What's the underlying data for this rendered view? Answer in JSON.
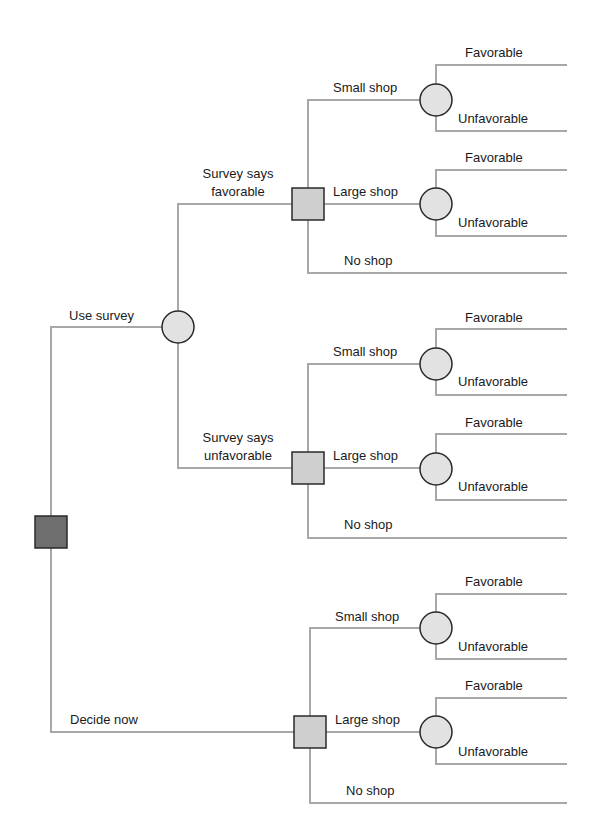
{
  "diagram": {
    "type": "decision-tree",
    "colors": {
      "branch": "#a8a8a8",
      "root_decision_fill": "#6e6e6e",
      "decision_fill": "#cfcfcf",
      "chance_fill": "#e2e2e2",
      "outline": "#2a2a2a",
      "text": "#1a1a1a"
    },
    "root": {
      "node_type": "decision",
      "branches": [
        {
          "label": "Use survey",
          "node_type": "chance",
          "branches": [
            {
              "label_line1": "Survey says",
              "label_line2": "favorable",
              "node_type": "decision",
              "branches": [
                {
                  "label": "Small shop",
                  "node_type": "chance",
                  "outcomes": [
                    "Favorable",
                    "Unfavorable"
                  ]
                },
                {
                  "label": "Large shop",
                  "node_type": "chance",
                  "outcomes": [
                    "Favorable",
                    "Unfavorable"
                  ]
                },
                {
                  "label": "No shop"
                }
              ]
            },
            {
              "label_line1": "Survey says",
              "label_line2": "unfavorable",
              "node_type": "decision",
              "branches": [
                {
                  "label": "Small shop",
                  "node_type": "chance",
                  "outcomes": [
                    "Favorable",
                    "Unfavorable"
                  ]
                },
                {
                  "label": "Large shop",
                  "node_type": "chance",
                  "outcomes": [
                    "Favorable",
                    "Unfavorable"
                  ]
                },
                {
                  "label": "No shop"
                }
              ]
            }
          ]
        },
        {
          "label": "Decide now",
          "node_type": "decision",
          "branches": [
            {
              "label": "Small shop",
              "node_type": "chance",
              "outcomes": [
                "Favorable",
                "Unfavorable"
              ]
            },
            {
              "label": "Large shop",
              "node_type": "chance",
              "outcomes": [
                "Favorable",
                "Unfavorable"
              ]
            },
            {
              "label": "No shop"
            }
          ]
        }
      ]
    }
  }
}
